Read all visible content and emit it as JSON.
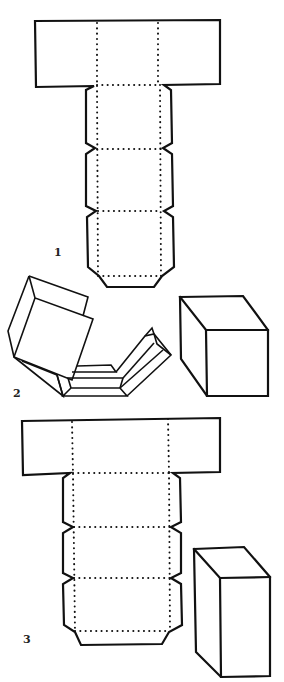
{
  "diagram": {
    "type": "box-net-instructions",
    "colors": {
      "line": "#111111",
      "background": "#ffffff"
    },
    "figures": [
      {
        "id": 1,
        "label": "1",
        "description": "Flat net of a cube: wide top band with two dotted fold lines, stem of three panels with notched side flaps and a bottom tab"
      },
      {
        "id": 2,
        "label": "2",
        "description": "Net partially folded into a box (left) and the finished cube (right)"
      },
      {
        "id": 3,
        "label": "3",
        "description": "Flat net of a taller rectangular box with the finished tall box beside it"
      }
    ]
  }
}
